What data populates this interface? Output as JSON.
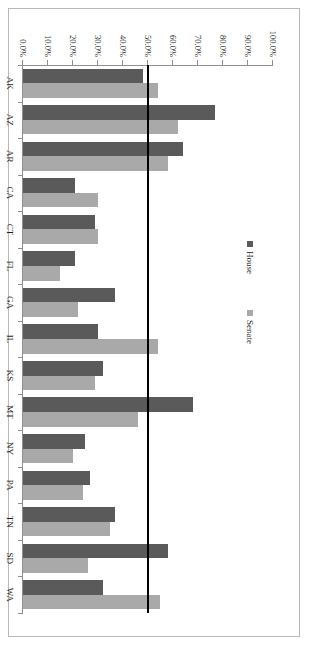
{
  "chart_data": {
    "type": "bar",
    "title": "",
    "subtitle": "",
    "xlabel": "",
    "ylabel": "",
    "ylim": [
      0,
      100
    ],
    "grid": false,
    "orientation": "vertical-rotated-90",
    "legend_position": "inside-upper-right",
    "categories": [
      "AK",
      "AZ",
      "AR",
      "CA",
      "CT",
      "FL",
      "GA",
      "IL",
      "KS",
      "MT",
      "NY",
      "PA",
      "TN",
      "SD",
      "WA"
    ],
    "tick_labels": [
      "100.0%",
      "90.0%",
      "80.0%",
      "70.0%",
      "60.0%",
      "50.0%",
      "40.0%",
      "30.0%",
      "20.0%",
      "10.0%",
      "0.0%"
    ],
    "tick_values": [
      100,
      90,
      80,
      70,
      60,
      50,
      40,
      30,
      20,
      10,
      0
    ],
    "reference_line": {
      "value": 50,
      "label": "50.0%",
      "color": "#000000"
    },
    "series": [
      {
        "name": "House",
        "color": "#5a5a5a",
        "values": [
          48,
          77,
          64,
          21,
          29,
          21,
          37,
          30,
          32,
          68,
          25,
          27,
          37,
          58,
          32
        ]
      },
      {
        "name": "Senate",
        "color": "#a9a9a9",
        "values": [
          54,
          62,
          58,
          30,
          30,
          15,
          22,
          54,
          29,
          46,
          20,
          24,
          35,
          26,
          55
        ]
      }
    ],
    "legend": [
      {
        "label": "House",
        "color": "#5a5a5a"
      },
      {
        "label": "Senate",
        "color": "#a9a9a9"
      }
    ]
  }
}
